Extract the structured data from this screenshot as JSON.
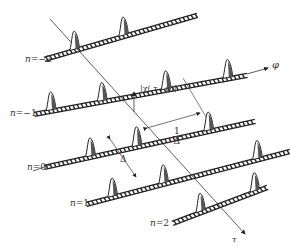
{
  "diagram": {
    "type": "3d-pulse-train-ambiguity-surface",
    "axes": {
      "phi_label": "φ",
      "tau_label": "τ",
      "amplitude_label": "|χ( τ , φ)|"
    },
    "annotations": {
      "delta_label": "Δ",
      "inverse_delta_num": "1",
      "inverse_delta_den": "Δ"
    },
    "rows": [
      {
        "label": "n=−2",
        "x1": 44,
        "y1": 58,
        "x2": 197,
        "y2": 14,
        "peaks": [
          0.2,
          0.52
        ]
      },
      {
        "label": "n=−1",
        "x1": 34,
        "y1": 113,
        "x2": 247,
        "y2": 74,
        "peaks": [
          0.08,
          0.32,
          0.62,
          0.91
        ]
      },
      {
        "label": "n=0",
        "x1": 44,
        "y1": 166,
        "x2": 255,
        "y2": 120,
        "peaks": [
          0.22,
          0.44,
          0.78
        ]
      },
      {
        "label": "n=1",
        "x1": 86,
        "y1": 203,
        "x2": 290,
        "y2": 150,
        "peaks": [
          0.13,
          0.38,
          0.84
        ]
      },
      {
        "label": "n=2",
        "x1": 172,
        "y1": 222,
        "x2": 267,
        "y2": 186,
        "peaks": [
          0.3,
          0.87
        ]
      }
    ],
    "colors": {
      "ink": "#222222",
      "fill": "#ffffff",
      "shade": "#555555"
    }
  }
}
